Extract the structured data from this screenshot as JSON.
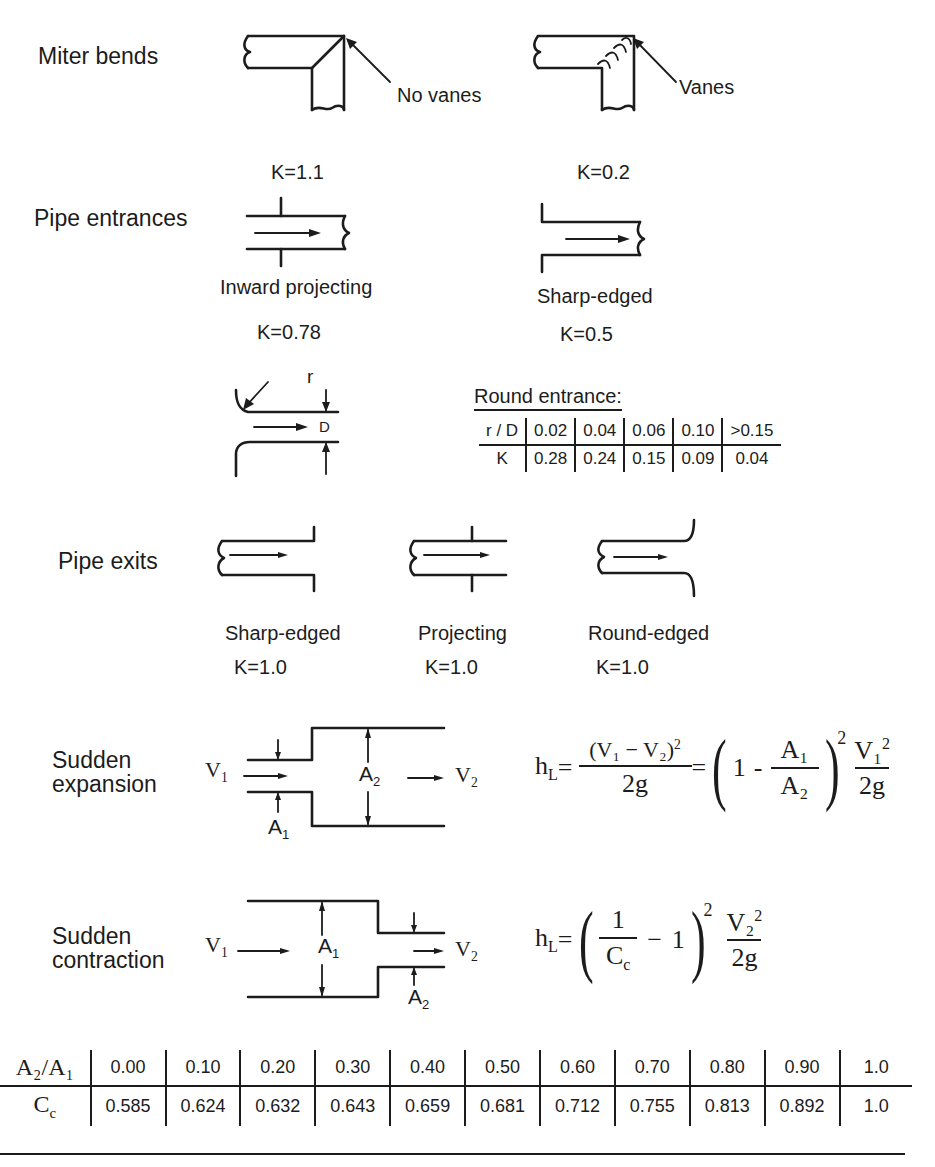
{
  "miter_bends": {
    "title": "Miter bends",
    "no_vanes": {
      "label": "No vanes",
      "k": "K=1.1"
    },
    "vanes": {
      "label": "Vanes",
      "k": "K=0.2"
    }
  },
  "pipe_entrances": {
    "title": "Pipe entrances",
    "inward_projecting": {
      "label": "Inward projecting",
      "k": "K=0.78"
    },
    "sharp_edged": {
      "label": "Sharp-edged",
      "k": "K=0.5"
    },
    "round_entrance": {
      "title": "Round entrance:",
      "diagram_labels": {
        "r": "r",
        "d": "D"
      },
      "header": [
        "r / D",
        "0.02",
        "0.04",
        "0.06",
        "0.10",
        ">0.15"
      ],
      "row": [
        "K",
        "0.28",
        "0.24",
        "0.15",
        "0.09",
        "0.04"
      ]
    }
  },
  "pipe_exits": {
    "title": "Pipe exits",
    "sharp_edged": {
      "label": "Sharp-edged",
      "k": "K=1.0"
    },
    "projecting": {
      "label": "Projecting",
      "k": "K=1.0"
    },
    "round_edged": {
      "label": "Round-edged",
      "k": "K=1.0"
    }
  },
  "sudden_expansion": {
    "title_line1": "Sudden",
    "title_line2": "expansion",
    "v1": "V",
    "v1_sub": "1",
    "v2": "V",
    "v2_sub": "2",
    "a1": "A",
    "a1_sub": "1",
    "a2": "A",
    "a2_sub": "2",
    "equation": {
      "lhs": "h",
      "lhs_sub": "L",
      "equals": "=",
      "num1": "(V₁ − V₂)",
      "num1_exp": "2",
      "den1": "2g",
      "one": "1",
      "minus": "-",
      "ratio_num": "A₁",
      "ratio_den": "A₂",
      "paren_exp": "2",
      "v_num": "V₁",
      "v_num_exp": "2",
      "v_den": "2g"
    }
  },
  "sudden_contraction": {
    "title_line1": "Sudden",
    "title_line2": "contraction",
    "v1": "V",
    "v1_sub": "1",
    "v2": "V",
    "v2_sub": "2",
    "a1": "A",
    "a1_sub": "1",
    "a2": "A",
    "a2_sub": "2",
    "equation": {
      "lhs": "h",
      "lhs_sub": "L",
      "equals": "=",
      "frac_num": "1",
      "frac_den": "C",
      "frac_den_sub": "c",
      "minus": "−",
      "one": "1",
      "paren_exp": "2",
      "v_num": "V₂",
      "v_num_exp": "2",
      "v_den": "2g"
    }
  },
  "contraction_table": {
    "header_label": "A₂/A₁",
    "row_label": "C",
    "row_label_sub": "c",
    "a2_over_a1": [
      "0.00",
      "0.10",
      "0.20",
      "0.30",
      "0.40",
      "0.50",
      "0.60",
      "0.70",
      "0.80",
      "0.90",
      "1.0"
    ],
    "cc": [
      "0.585",
      "0.624",
      "0.632",
      "0.643",
      "0.659",
      "0.681",
      "0.712",
      "0.755",
      "0.813",
      "0.892",
      "1.0"
    ]
  }
}
